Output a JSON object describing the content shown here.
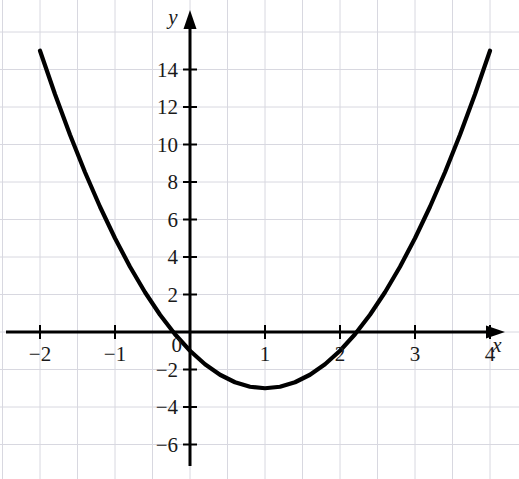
{
  "chart_data": {
    "type": "line",
    "title": "",
    "subtitle": "",
    "xlabel": "x",
    "ylabel": "y",
    "xlim": [
      -2.5,
      4.4
    ],
    "ylim": [
      -7.2,
      15.8
    ],
    "grid": true,
    "legend": false,
    "equation": "y = 2x^2 - 4x - 1",
    "vertex": [
      1,
      -3
    ],
    "x_ticks": [
      -2,
      -1,
      0,
      1,
      2,
      3,
      4
    ],
    "x_tick_labels": [
      "−2",
      "−1",
      "0",
      "1",
      "2",
      "3",
      "4"
    ],
    "y_ticks": [
      -6,
      -4,
      -2,
      2,
      4,
      6,
      8,
      10,
      12,
      14
    ],
    "y_tick_labels": [
      "−6",
      "−4",
      "−2",
      "2",
      "4",
      "6",
      "8",
      "10",
      "12",
      "14"
    ],
    "origin_label": "0",
    "series": [
      {
        "name": "parabola",
        "color": "#000000",
        "x": [
          -2,
          -1.8,
          -1.6,
          -1.4,
          -1.2,
          -1,
          -0.8,
          -0.6,
          -0.4,
          -0.2,
          0,
          0.2,
          0.4,
          0.6,
          0.8,
          1,
          1.2,
          1.4,
          1.6,
          1.8,
          2,
          2.2,
          2.4,
          2.6,
          2.8,
          3,
          3.2,
          3.4,
          3.6,
          3.8,
          4
        ],
        "y": [
          15,
          12.68,
          10.52,
          8.52,
          6.68,
          5,
          3.48,
          2.12,
          0.92,
          -0.12,
          -1,
          -1.72,
          -2.28,
          -2.68,
          -2.92,
          -3,
          -2.92,
          -2.68,
          -2.28,
          -1.72,
          -1,
          -0.12,
          0.92,
          2.12,
          3.48,
          5,
          6.68,
          8.52,
          10.52,
          12.68,
          15
        ]
      }
    ],
    "axis_arrows": [
      "x-positive",
      "y-positive"
    ],
    "curve_style": {
      "width": 4.2,
      "cap": "round"
    },
    "grid_color": "#d8d8e0",
    "axis_color": "#000000",
    "background": "#ffffff"
  },
  "geometry": {
    "origin_px": [
      190,
      332
    ],
    "unit_x_px": 75,
    "unit_y_px": 18.75,
    "grid_step_px": 37.5
  }
}
